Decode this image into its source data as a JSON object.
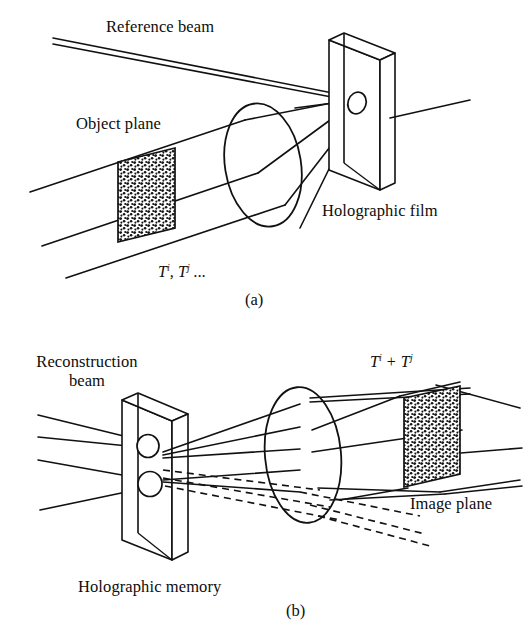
{
  "figure": {
    "stroke_color": "#111111",
    "background_color": "#ffffff",
    "stipple_fill": "#f2f2f2"
  },
  "panel_a": {
    "caption": "(a)",
    "labels": {
      "reference_beam": "Reference beam",
      "object_plane": "Object plane",
      "holographic_film": "Holographic film",
      "transparency_symbol_base": "T",
      "transparency_symbol_sup1": "i",
      "transparency_symbol_mid": ", T",
      "transparency_symbol_sup2": "j",
      "transparency_symbol_tail": " ..."
    }
  },
  "panel_b": {
    "caption": "(b)",
    "labels": {
      "reconstruction_beam_line1": "Reconstruction",
      "reconstruction_beam_line2": "beam",
      "holographic_memory": "Holographic memory",
      "image_plane": "Image plane",
      "sum_symbol_base": "T",
      "sum_symbol_sup1": "i",
      "sum_symbol_mid": " + T",
      "sum_symbol_sup2": "j"
    }
  }
}
